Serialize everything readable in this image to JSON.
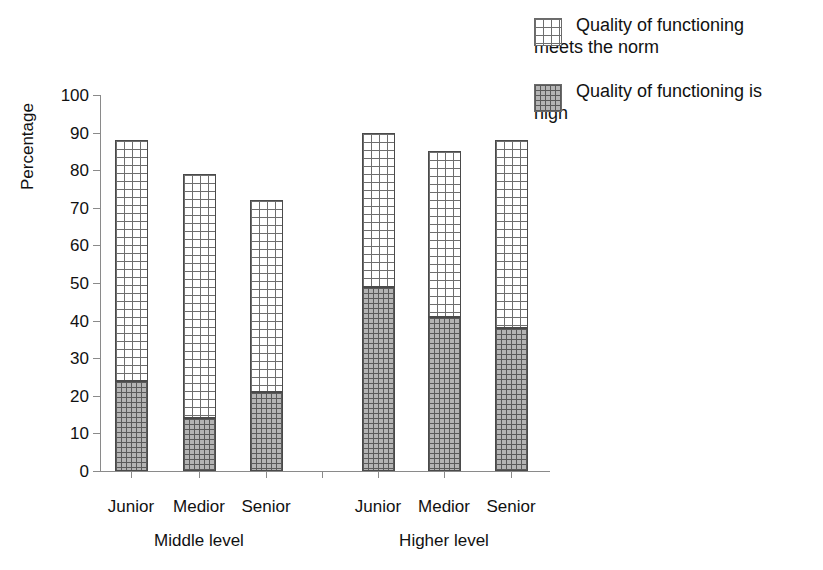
{
  "chart_data": {
    "type": "bar",
    "subtype": "stacked",
    "title": "",
    "xlabel": "",
    "ylabel": "Percentage",
    "ylim": [
      0,
      100
    ],
    "ytick_labels": [
      "0",
      "10",
      "20",
      "30",
      "40",
      "50",
      "60",
      "70",
      "80",
      "90",
      "100"
    ],
    "yticks": [
      0,
      10,
      20,
      30,
      40,
      50,
      60,
      70,
      80,
      90,
      100
    ],
    "grid": false,
    "legend_position": "top-right",
    "categories": [
      "Junior",
      "Medior",
      "Senior",
      "Junior",
      "Medior",
      "Senior"
    ],
    "groups": [
      {
        "label": "Middle level",
        "categories": [
          "Junior",
          "Medior",
          "Senior"
        ]
      },
      {
        "label": "Higher level",
        "categories": [
          "Junior",
          "Medior",
          "Senior"
        ]
      }
    ],
    "series": [
      {
        "name": "Quality of functioning is high",
        "values": [
          24,
          14,
          21,
          49,
          41,
          38
        ],
        "fill": "#b4b4b4"
      },
      {
        "name": "Quality of functioning meets the norm",
        "values": [
          64,
          65,
          51,
          41,
          44,
          50
        ],
        "fill": "#ffffff"
      }
    ],
    "totals": [
      88,
      79,
      72,
      90,
      85,
      88
    ]
  },
  "legend": {
    "items": [
      {
        "label": "Quality of functioning\nmeets the norm",
        "swatch": "light-grid-swatch"
      },
      {
        "label": "Quality of functioning is\nhigh",
        "swatch": "dark-grid-swatch"
      }
    ]
  },
  "axis": {
    "y_title": "Percentage"
  }
}
